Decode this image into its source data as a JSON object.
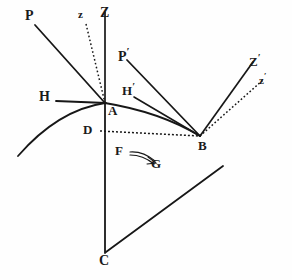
{
  "figure": {
    "background_color": "#fefefe",
    "ink_color": "#171717",
    "width": 292,
    "height": 280
  },
  "labels": {
    "z_upper_left": "z",
    "Z_vertical": "Z",
    "P_upper_left": "P",
    "H_left": "H",
    "A_vertex": "A",
    "D_left": "D",
    "F_arrow_tail": "F",
    "G_arrow_head": "G",
    "C_bottom": "C",
    "P_prime_base": "P",
    "P_prime_mark": "′",
    "H_prime_base": "H",
    "H_prime_mark": "′",
    "Z_prime_base": "Z",
    "Z_prime_mark": "′",
    "z_prime_base": "z",
    "z_prime_mark": "′",
    "B_right": "B"
  },
  "points": {
    "A": {
      "name": "A",
      "x": 105,
      "y": 103
    },
    "B": {
      "name": "B",
      "x": 200,
      "y": 136
    },
    "C": {
      "name": "C",
      "x": 105,
      "y": 253
    },
    "D": {
      "name": "D",
      "x": 100,
      "y": 131
    }
  },
  "elements": {
    "vertical_axis": "Z-A-C vertical line",
    "normal_dotted_at_A": "z-A dotted normal",
    "incident_ray_P": "P to A solid ray",
    "horizontal_H": "H to A horizontal line",
    "refracted_ray_P_prime": "P' to B solid ray",
    "horizontal_H_prime": "H' to B line",
    "normal_Z_prime_at_B": "B to Z' solid normal",
    "normal_dotted_z_prime_at_B": "B to z' dotted normal",
    "ray_C_through_B": "C through B extended ray",
    "curve_path": "curved ray path through A and B",
    "dotted_horizontal_D_B": "D to B dotted horizontal",
    "arrow_F_to_G": "curved double-line arrow from F to G"
  }
}
